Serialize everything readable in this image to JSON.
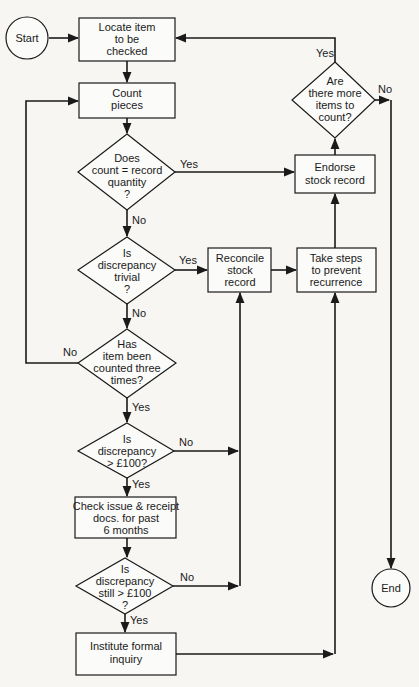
{
  "colors": {
    "background": "#f7f6f3",
    "ink": "#1a1a1a"
  },
  "nodes": {
    "start": {
      "type": "terminal",
      "lines": [
        "Start"
      ]
    },
    "locate": {
      "type": "process",
      "lines": [
        "Locate item",
        "to be",
        "checked"
      ]
    },
    "count": {
      "type": "process",
      "lines": [
        "Count",
        "pieces"
      ]
    },
    "d_match": {
      "type": "decision",
      "lines": [
        "Does",
        "count = record",
        "quantity",
        "?"
      ]
    },
    "d_trivial": {
      "type": "decision",
      "lines": [
        "Is",
        "discrepancy",
        "trivial",
        "?"
      ]
    },
    "d_three": {
      "type": "decision",
      "lines": [
        "Has",
        "item been",
        "counted three",
        "times?"
      ]
    },
    "d_100": {
      "type": "decision",
      "lines": [
        "Is",
        "discrepancy",
        "> £100?"
      ]
    },
    "check": {
      "type": "process",
      "lines": [
        "Check issue & receipt",
        "docs. for past",
        "6 months"
      ]
    },
    "d_still": {
      "type": "decision",
      "lines": [
        "Is",
        "discrepancy",
        "still > £100",
        "?"
      ]
    },
    "inquiry": {
      "type": "process",
      "lines": [
        "Institute formal",
        "inquiry"
      ]
    },
    "reconcile": {
      "type": "process",
      "lines": [
        "Reconcile",
        "stock",
        "record"
      ]
    },
    "prevent": {
      "type": "process",
      "lines": [
        "Take steps",
        "to prevent",
        "recurrence"
      ]
    },
    "endorse": {
      "type": "process",
      "lines": [
        "Endorse",
        "stock record"
      ]
    },
    "d_more": {
      "type": "decision",
      "lines": [
        "Are",
        "there more",
        "items to",
        "count?"
      ]
    },
    "end": {
      "type": "terminal",
      "lines": [
        "End"
      ]
    }
  },
  "edge_labels": {
    "match_yes": "Yes",
    "match_no": "No",
    "trivial_yes": "Yes",
    "trivial_no": "No",
    "three_no": "No",
    "three_yes": "Yes",
    "over100_no": "No",
    "over100_yes": "Yes",
    "still_no": "No",
    "still_yes": "Yes",
    "more_yes": "Yes",
    "more_no": "No"
  },
  "edges": [
    {
      "from": "start",
      "to": "locate"
    },
    {
      "from": "locate",
      "to": "count"
    },
    {
      "from": "count",
      "to": "d_match"
    },
    {
      "from": "d_match",
      "to": "endorse",
      "label": "Yes"
    },
    {
      "from": "d_match",
      "to": "d_trivial",
      "label": "No"
    },
    {
      "from": "d_trivial",
      "to": "reconcile",
      "label": "Yes"
    },
    {
      "from": "d_trivial",
      "to": "d_three",
      "label": "No"
    },
    {
      "from": "d_three",
      "to": "count",
      "label": "No"
    },
    {
      "from": "d_three",
      "to": "d_100",
      "label": "Yes"
    },
    {
      "from": "d_100",
      "to": "reconcile",
      "label": "No"
    },
    {
      "from": "d_100",
      "to": "check",
      "label": "Yes"
    },
    {
      "from": "check",
      "to": "d_still"
    },
    {
      "from": "d_still",
      "to": "reconcile",
      "label": "No"
    },
    {
      "from": "d_still",
      "to": "inquiry",
      "label": "Yes"
    },
    {
      "from": "inquiry",
      "to": "prevent"
    },
    {
      "from": "reconcile",
      "to": "prevent"
    },
    {
      "from": "prevent",
      "to": "endorse"
    },
    {
      "from": "endorse",
      "to": "d_more"
    },
    {
      "from": "d_more",
      "to": "locate",
      "label": "Yes"
    },
    {
      "from": "d_more",
      "to": "end",
      "label": "No"
    }
  ]
}
